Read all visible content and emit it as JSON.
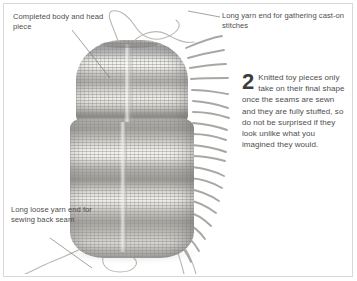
{
  "page": {
    "width": 357,
    "height": 281,
    "background_color": "#ffffff",
    "border_color": "#d8d8d8",
    "text_color": "#4e4e4e"
  },
  "captions": {
    "top_left": {
      "name": "completed-body-and-head-piece",
      "text": "Completed body and head piece"
    },
    "top_right": {
      "name": "long-yarn-end-gathering",
      "text": "Long yarn end for gathering cast-on stitches"
    },
    "bottom_left": {
      "name": "long-loose-yarn-end-back-seam",
      "text": "Long loose yarn end for sewing back seam"
    }
  },
  "step": {
    "number": "2",
    "text": "Knitted toy pieces only take on their final shape once the seams are sewn and they are fully stuffed, so do not be surprised if they look unlike what you imagined they would."
  },
  "photo": {
    "subject": "knitted-toy-body-and-head-piece",
    "description": "Grey and cream striped knitted toy piece with loose yarn fringe along the right edge and long yarn ends trailing at the top and bottom",
    "stripe_colors": [
      "#a3a19c",
      "#b9b7b2",
      "#cfcfcf",
      "#d9d7d2",
      "#efeeea",
      "#f3f2ee",
      "#8e8c88"
    ],
    "fringe_color": "#9a9893",
    "yarn_color": "#b4b2ad"
  }
}
